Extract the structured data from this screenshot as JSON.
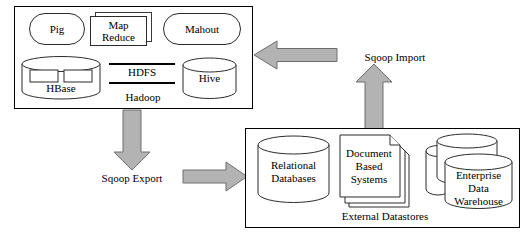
{
  "diagram": {
    "colors": {
      "arrow_fill": "#b3b3b3",
      "arrow_stroke": "#6e6e6e",
      "shape_stroke": "#2b2b2b",
      "box_stroke": "#000000",
      "background": "#ffffff",
      "text": "#000000"
    },
    "hadoop_group": {
      "label": "Hadoop",
      "nodes": [
        {
          "id": "pig",
          "label": "Pig",
          "shape": "rounded-rectangle"
        },
        {
          "id": "mapreduce",
          "label": "Map\nReduce",
          "line1": "Map",
          "line2": "Reduce",
          "shape": "stacked-rectangle"
        },
        {
          "id": "mahout",
          "label": "Mahout",
          "shape": "rounded-rectangle"
        },
        {
          "id": "hbase",
          "label": "HBase",
          "shape": "cylinder-with-tables"
        },
        {
          "id": "hdfs",
          "label": "HDFS",
          "shape": "banded-text"
        },
        {
          "id": "hive",
          "label": "Hive",
          "shape": "cylinder"
        }
      ]
    },
    "external_group": {
      "label": "External Datastores",
      "nodes": [
        {
          "id": "relational-databases",
          "line1": "Relational",
          "line2": "Databases",
          "shape": "cylinder"
        },
        {
          "id": "document-based-systems",
          "line1": "Document",
          "line2": "Based",
          "line3": "Systems",
          "shape": "stacked-document"
        },
        {
          "id": "enterprise-data-warehouse",
          "line1": "Enterprise",
          "line2": "Data",
          "line3": "Warehouse",
          "shape": "stacked-cylinder"
        }
      ]
    },
    "arrows": [
      {
        "id": "sqoop-import-horizontal",
        "label": "",
        "direction": "left"
      },
      {
        "id": "sqoop-import-vertical",
        "label": "Sqoop Import",
        "direction": "up"
      },
      {
        "id": "sqoop-export-vertical",
        "label": "Sqoop Export",
        "direction": "down"
      },
      {
        "id": "sqoop-export-horizontal",
        "label": "",
        "direction": "right"
      }
    ],
    "labels": {
      "sqoop_import": "Sqoop Import",
      "sqoop_export": "Sqoop Export"
    }
  }
}
